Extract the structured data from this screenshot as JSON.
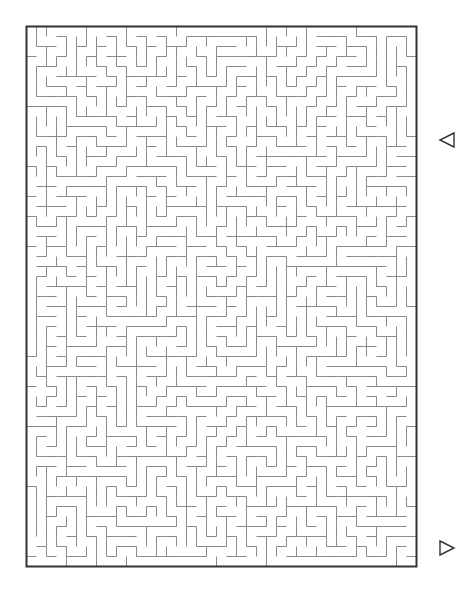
{
  "page": {
    "background_color": "#ffffff",
    "width": 474,
    "height": 597
  },
  "maze": {
    "name": "rectangular-maze",
    "type": "perfect-maze",
    "origin_x": 26,
    "origin_y": 26,
    "cell_size": 10,
    "cols": 39,
    "rows": 54,
    "wall_color": "#8a8a8a",
    "wall_width": 1,
    "border_color": "#333333",
    "border_width": 2,
    "seed": 20240517
  },
  "markers": {
    "entrance": {
      "label": "entrance-arrow",
      "glyph": "◁",
      "direction": "left",
      "x": 440,
      "y": 140,
      "size": 14,
      "color": "#333333"
    },
    "exit": {
      "label": "exit-arrow",
      "glyph": "▷",
      "direction": "right",
      "x": 440,
      "y": 548,
      "size": 14,
      "color": "#333333"
    }
  }
}
